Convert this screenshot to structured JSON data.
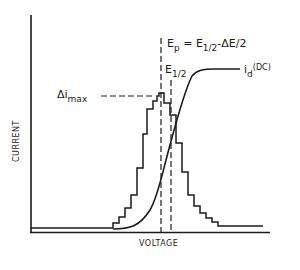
{
  "diagram": {
    "type": "voltammogram",
    "axes": {
      "x_label": "VOLTAGE",
      "y_label": "CURRENT"
    },
    "annotations": {
      "ep_label_main": "E",
      "ep_label_sub": "p",
      "ep_equation_eq": " = E",
      "ep_equation_sub": "1/2",
      "ep_equation_rest": "-ΔE/2",
      "e_half_main": "E",
      "e_half_sub": "1/2",
      "delta_i_main": "Δi",
      "delta_i_sub": "max",
      "id_main": "i",
      "id_sub": "d",
      "id_sup": "(DC)"
    },
    "series": [
      {
        "name": "differential pulse staircase (Δi)",
        "style": "stepped histogram",
        "peak_at": "E_p"
      },
      {
        "name": "i_d (DC) sigmoid wave",
        "style": "solid curve",
        "half_wave_at": "E_1/2"
      }
    ],
    "reference_lines": [
      {
        "name": "E_p",
        "style": "dashed vertical"
      },
      {
        "name": "E_1/2",
        "style": "dashed vertical"
      },
      {
        "name": "Δi_max",
        "style": "dashed horizontal"
      }
    ],
    "colors": {
      "ink": "#1a1a1a",
      "background": "#ffffff"
    }
  }
}
